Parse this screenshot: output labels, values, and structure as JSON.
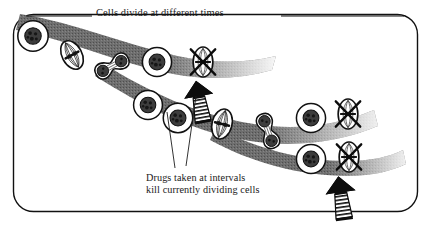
{
  "figure": {
    "kind": "biology-diagram",
    "border": {
      "shape": "rounded-rectangle",
      "color": "#111111"
    }
  },
  "annotations": {
    "title": {
      "text": "Cells divide at different times",
      "leader_left": "horizontal-rule",
      "leader_right": "horizontal-rule"
    },
    "drug_note": {
      "line1": "Drugs taken at intervals",
      "line2": "kill currently dividing cells",
      "leader_count": 2
    }
  },
  "colors": {
    "band_gray": "#6e6e6e",
    "band_gray_dark": "#5c5c5c",
    "outline": "#111111",
    "cytoplasm": "#ffffff",
    "nucleus": "#3a3a3a",
    "arrow_fill": "#0d0d0d",
    "background": "#ffffff"
  },
  "legend_stages": [
    {
      "key": "interphase",
      "label": "interphase cell",
      "shape": "round, speckled nucleus"
    },
    {
      "key": "metaphase",
      "label": "dividing cell (spindle)",
      "shape": "lens with spindle fibers"
    },
    {
      "key": "telophase",
      "label": "dividing cell (dumbbell)",
      "shape": "two lobes joined"
    },
    {
      "key": "killed",
      "label": "killed dividing cell",
      "shape": "spindle crossed out with X"
    }
  ],
  "lineages": [
    {
      "id": "upper-band",
      "name": "upper cell lineage",
      "cells": [
        {
          "stage": "interphase",
          "x": 33,
          "y": 36,
          "r": 16,
          "rot": -20
        },
        {
          "stage": "metaphase",
          "x": 72,
          "y": 55,
          "rot": -28
        },
        {
          "stage": "telophase",
          "x": 112,
          "y": 66,
          "rot": -35
        },
        {
          "stage": "interphase",
          "x": 157,
          "y": 62,
          "r": 15,
          "rot": 0
        },
        {
          "stage": "killed",
          "x": 203,
          "y": 62,
          "rot": 0
        }
      ]
    },
    {
      "id": "middle-band",
      "name": "middle cell lineage",
      "cells": [
        {
          "stage": "interphase",
          "x": 148,
          "y": 105,
          "r": 15,
          "rot": 0
        },
        {
          "stage": "interphase",
          "x": 176,
          "y": 117,
          "r": 15,
          "rot": 0
        },
        {
          "stage": "metaphase",
          "x": 221,
          "y": 124,
          "rot": 76
        },
        {
          "stage": "telophase",
          "x": 268,
          "y": 131,
          "rot": 72
        },
        {
          "stage": "interphase",
          "x": 310,
          "y": 117,
          "r": 15,
          "rot": 0
        },
        {
          "stage": "killed",
          "x": 347,
          "y": 114,
          "rot": 0
        }
      ]
    },
    {
      "id": "lower-band",
      "name": "lower cell lineage",
      "cells": [
        {
          "stage": "interphase",
          "x": 311,
          "y": 158,
          "r": 15,
          "rot": 0
        },
        {
          "stage": "killed",
          "x": 348,
          "y": 156,
          "rot": 0
        }
      ]
    }
  ],
  "drug_arrows": [
    {
      "id": "arrow-upper",
      "name": "drug dose arrow upper",
      "target_cell": "upper-band killed cell",
      "tip_x": 196,
      "tip_y": 80,
      "angle": -12
    },
    {
      "id": "arrow-lower",
      "name": "drug dose arrow lower",
      "target_cell": "lower-band killed cell",
      "tip_x": 340,
      "tip_y": 175,
      "angle": -8
    }
  ]
}
